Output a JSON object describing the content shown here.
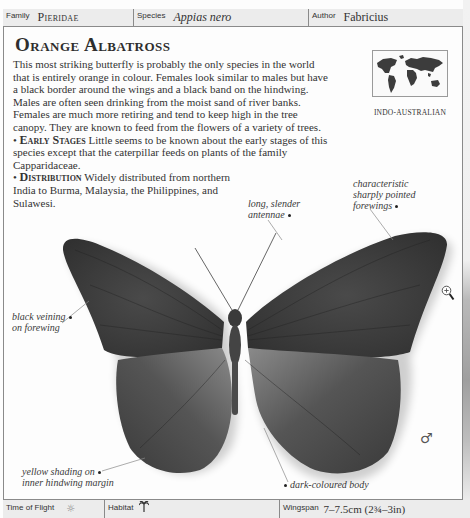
{
  "header": {
    "family_label": "Family",
    "family_value": "Pieridae",
    "species_label": "Species",
    "species_value": "Appias nero",
    "author_label": "Author",
    "author_value": "Fabricius"
  },
  "title": "Orange Albatross",
  "description": "This most striking butterfly is probably the only species in the world that is entirely orange in colour. Females look similar to males but have a black border around the wings and a black band on the hindwing. Males are often seen drinking from the moist sand of river banks. Females are much more retiring and tend to keep high in the tree canopy. They are known to feed from the flowers of a variety of trees.",
  "sections": [
    {
      "bullet": "•",
      "heading": "Early Stages",
      "text": "Little seems to be known about the early stages of this species except that the caterpillar feeds on plants of the family Capparidaceae."
    },
    {
      "bullet": "•",
      "heading": "Distribution",
      "text": "Widely distributed from northern India to Burma, Malaysia, the Philippines, and Sulawesi."
    }
  ],
  "region": {
    "label": "INDO-AUSTRALIAN",
    "icon": "world-map-icon"
  },
  "annotations": {
    "antennae": [
      "long, slender",
      "antennae"
    ],
    "forewings": [
      "characteristic",
      "sharply pointed",
      "forewings"
    ],
    "veining": [
      "black veining",
      "on forewing"
    ],
    "hindwing": [
      "yellow shading on",
      "inner hindwing margin"
    ],
    "body": "dark-coloured body"
  },
  "icons": {
    "zoom": "zoom-in-icon",
    "sex": "♂",
    "time_of_flight": "☼",
    "habitat": "🌴"
  },
  "footer": {
    "time_label": "Time of Flight",
    "habitat_label": "Habitat",
    "wingspan_label": "Wingspan",
    "wingspan_value": "7–7.5cm (2¾–3in)"
  },
  "colors": {
    "wing_dark": "#3a3a3a",
    "wing_mid": "#555555",
    "bar_bg": "#ececec",
    "border": "#8a8a8a"
  }
}
